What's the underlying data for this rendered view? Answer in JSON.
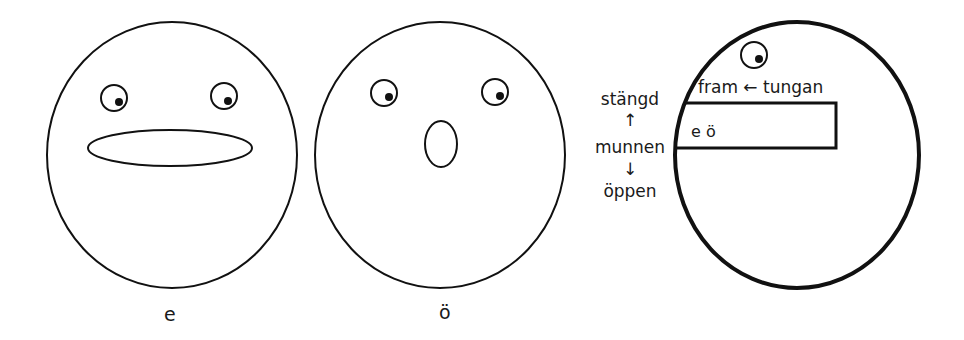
{
  "diagram": {
    "title": "",
    "faces": [
      {
        "id": "face-e",
        "label": "e",
        "mouth": "wide-flat"
      },
      {
        "id": "face-o-umlaut",
        "label": "ö",
        "mouth": "small-round"
      }
    ],
    "profile": {
      "tongue_label": "fram ← tungan",
      "box_label": "e ö",
      "mouth_scale": {
        "top": "stängd",
        "up_arrow": "↑",
        "middle": "munnen",
        "down_arrow": "↓",
        "bottom": "öppen"
      }
    },
    "colors": {
      "stroke": "#111111",
      "background": "#ffffff"
    }
  }
}
